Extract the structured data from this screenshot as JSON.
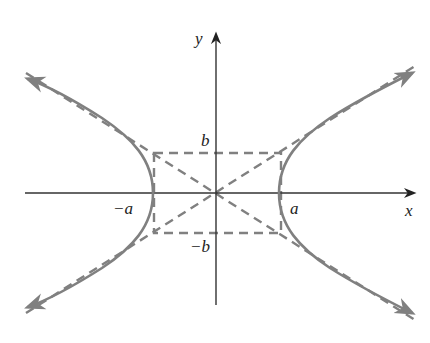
{
  "diagram": {
    "type": "hyperbola",
    "colors": {
      "axes": "#333333",
      "curve": "#808080",
      "dashed": "#808080",
      "text": "#222222"
    },
    "labels": {
      "x_axis": "x",
      "y_axis": "y",
      "pos_a": "a",
      "neg_a": "−a",
      "pos_b": "b",
      "neg_b": "−b"
    },
    "geometry": {
      "origin": [
        216,
        193
      ],
      "a_px": 63,
      "b_px": 40
    }
  }
}
